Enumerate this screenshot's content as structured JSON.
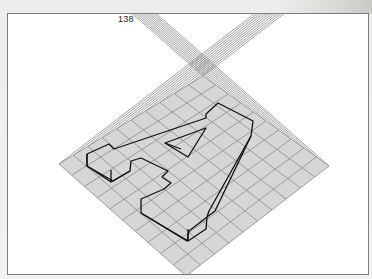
{
  "page": {
    "number": "138"
  },
  "figure": {
    "colors": {
      "frame": "#7d7d7d",
      "guide_lines": "#8a8a8a",
      "grid_fill": "#d6d6d6",
      "grid_lines": "#8c8c8c",
      "letter_outline": "#111111"
    },
    "grid": {
      "top": [
        202,
        75
      ],
      "right": [
        328,
        165
      ],
      "bottom": [
        185,
        275
      ],
      "left": [
        58,
        163
      ],
      "divisions": 10
    },
    "letter": "A"
  }
}
